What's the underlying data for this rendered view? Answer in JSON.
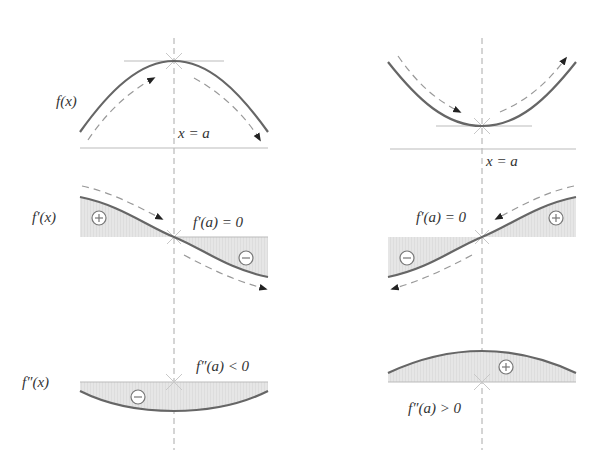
{
  "diagram": {
    "colors": {
      "curve": "#666666",
      "fill": "#e3e3e3",
      "guide": "#bbbbbb",
      "text": "#333333"
    },
    "left_column": {
      "case": "local maximum",
      "row1": {
        "label": "f(x)",
        "axis_label": "x = a"
      },
      "row2": {
        "label": "f′(x)",
        "condition": "f′(a) = 0",
        "signs": [
          "+",
          "−"
        ]
      },
      "row3": {
        "label": "f″(x)",
        "condition": "f″(a) < 0",
        "signs": [
          "−"
        ]
      }
    },
    "right_column": {
      "case": "local minimum",
      "row1": {
        "axis_label": "x = a"
      },
      "row2": {
        "condition": "f′(a) = 0",
        "signs": [
          "−",
          "+"
        ]
      },
      "row3": {
        "condition": "f″(a) > 0",
        "signs": [
          "+"
        ]
      }
    }
  }
}
